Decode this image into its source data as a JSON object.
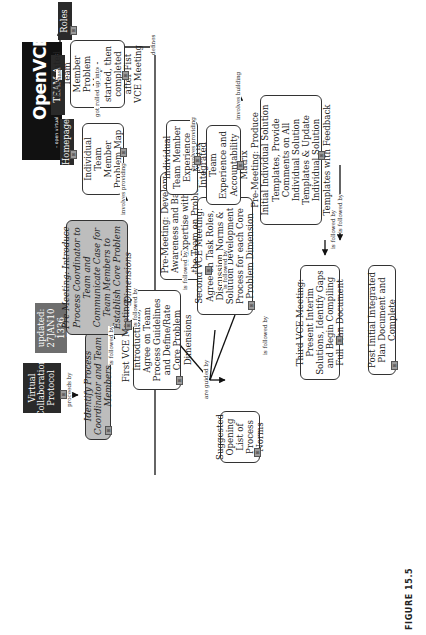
{
  "figure_caption": "FIGURE 15.5",
  "logo": {
    "word": "OpenVCE",
    "tagline": "– open virtual collaboration environment"
  },
  "nodes": {
    "virtual_collaboration_protocol": "Virtual Collaboration Protocol",
    "last_updated": "Last updated: 27JAN10 1336 ESE",
    "identify": "Identify Process Coordinator and Team Members",
    "pre_meeting_intro": "Pre-Meeting: Introduce Process Coordinator to Team and Communicate Case for Team Members to Establish Core Problem Dimensions",
    "first_vce": "First VCE Meeting: Introductions, Agree on Team Process Guidelines and Define/Rate Core Problem Dimensions",
    "pre_meeting_awareness": "Pre-Meeting: Develop Awareness and Bases of Expertise within the Team on Problem Dimensions",
    "second_vce": "Second VCE Meeting: Agree on Task Roles, Discussion Norms & Solution Development Process for each Core Problem Dimension",
    "suggested_norms": "Suggested Opening List of Process Norms",
    "pre_meeting_solutions": "Pre-Meeting: Produce Initial Individual Solution Templates, Provide Comments on All Individual Solution Templates & Update Individual Solution Templates with Feedback",
    "third_vce": "Third VCE Meeting: Present Interim Solutions, Identify Gaps and Begin Compiling Full Plan Document",
    "post_initial": "Post Initial Integrated Plan Document and Complete",
    "individual_problem_map": "Individual Team Member Problem Map",
    "integrated_problem_map": "Integrated Team Member Problem Map -started, then completed after Fist VCE Meeting",
    "individual_experience": "Individual Team Member Experience Matrix",
    "integrated_experience": "Integrated Team Experience and Accountability Matrix",
    "team_a": "TEAM A",
    "homepage": "Homepage",
    "roles": "Roles"
  },
  "links": {
    "proceeds_by": "proceeds by",
    "is_followed_by": "is followed by",
    "involves_providing": "involves providing",
    "involves_building": "involves building",
    "got_rolled_up_into": "got rolled up into",
    "has": "has",
    "defines": "defines",
    "are_guided_by": "are guided by"
  },
  "badge_glyph": "⊞"
}
